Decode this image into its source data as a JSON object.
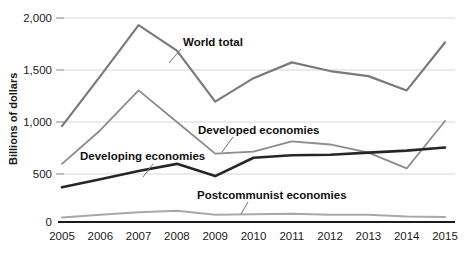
{
  "chart_data": {
    "type": "line",
    "title": "",
    "xlabel": "",
    "ylabel": "Billions of dollars",
    "categories": [
      "2005",
      "2006",
      "2007",
      "2008",
      "2009",
      "2010",
      "2011",
      "2012",
      "2013",
      "2014",
      "2015"
    ],
    "x": [
      2005,
      2006,
      2007,
      2008,
      2009,
      2010,
      2011,
      2012,
      2013,
      2014,
      2015
    ],
    "xlim": [
      2005,
      2015
    ],
    "ylim": [
      0,
      2000
    ],
    "yticks": [
      0,
      500,
      1000,
      1500,
      2000
    ],
    "ytick_labels": [
      "0",
      "500",
      "1,000",
      "1,500",
      "2,000"
    ],
    "grid": "horizontal",
    "legend": "inline-annotations",
    "series": [
      {
        "name": "World total",
        "color": "#7a7a7a",
        "width": 2.2,
        "values": [
          940,
          1430,
          1930,
          1680,
          1180,
          1410,
          1565,
          1480,
          1430,
          1290,
          1760
        ]
      },
      {
        "name": "Developing economies",
        "color": "#8c8c8c",
        "width": 1.8,
        "values": [
          570,
          900,
          1290,
          980,
          670,
          690,
          790,
          760,
          680,
          525,
          990
        ]
      },
      {
        "name": "Developed economies",
        "color": "#262626",
        "width": 2.6,
        "values": [
          340,
          420,
          500,
          570,
          450,
          630,
          655,
          660,
          680,
          700,
          730
        ]
      },
      {
        "name": "Postcommunist economies",
        "color": "#a8a8a8",
        "width": 2.0,
        "values": [
          45,
          70,
          95,
          110,
          70,
          75,
          80,
          70,
          70,
          55,
          50
        ]
      }
    ],
    "annotations": [
      {
        "text": "World total",
        "x": 183,
        "y": 46
      },
      {
        "text": "Developing economies",
        "x": 80,
        "y": 160
      },
      {
        "text": "Developed economies",
        "x": 198,
        "y": 134
      },
      {
        "text": "Postcommunist economies",
        "x": 197,
        "y": 199
      }
    ]
  },
  "axis": {
    "y_axis_title": "Billions of dollars",
    "y_tick_labels": [
      "2,000",
      "1,500",
      "1,000",
      "500",
      "0"
    ],
    "x_tick_labels": [
      "2005",
      "2006",
      "2007",
      "2008",
      "2009",
      "2010",
      "2011",
      "2012",
      "2013",
      "2014",
      "2015"
    ]
  },
  "colors": {
    "world_total": "#7a7a7a",
    "developing": "#8c8c8c",
    "developed": "#262626",
    "postcommunist": "#a8a8a8",
    "grid": "#d6d6d6",
    "axis": "#1a1a1a",
    "background": "#ffffff"
  }
}
